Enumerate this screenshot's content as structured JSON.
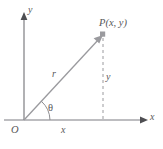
{
  "figure": {
    "colors": {
      "line": "#8d8d91",
      "axis": "#7d7d81",
      "label": "#58585a",
      "background": "#ffffff",
      "point_marker": "#9a9a9e"
    },
    "labels": {
      "y_axis": "y",
      "x_axis": "x",
      "origin": "O",
      "point": "P(x, y)",
      "radius": "r",
      "angle": "θ",
      "side_x": "x",
      "side_y": "y"
    },
    "icons": {
      "point_marker": "square-point-marker",
      "axis_arrow": "arrowhead-icon",
      "vector_arrow": "vector-arrowhead-icon"
    },
    "geometry": {
      "origin_px": [
        24,
        120
      ],
      "point_px": [
        103,
        35
      ],
      "x_axis_end_px": [
        146,
        120
      ],
      "y_axis_end_px": [
        24,
        14
      ],
      "angle_arc_radius_px": 26
    }
  }
}
